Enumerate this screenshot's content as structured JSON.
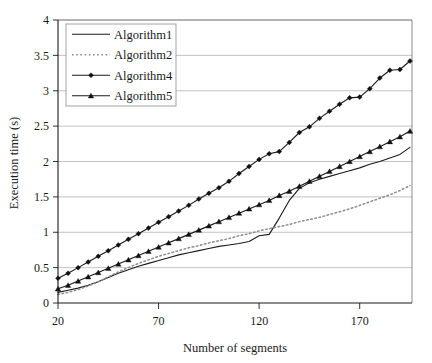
{
  "chart_data": {
    "type": "line",
    "title": "",
    "xlabel": "Number of segments",
    "ylabel": "Execution time (s)",
    "xlim": [
      20,
      196
    ],
    "ylim": [
      0,
      4
    ],
    "xticks": [
      20,
      70,
      120,
      170
    ],
    "xtick_labels": [
      "20",
      "70",
      "120",
      "170"
    ],
    "yticks": [
      0,
      0.5,
      1,
      1.5,
      2,
      2.5,
      3,
      3.5,
      4
    ],
    "ytick_labels": [
      "0",
      "0.5",
      "1",
      "1.5",
      "2",
      "2.5",
      "3",
      "3.5",
      "4"
    ],
    "grid": "horizontal",
    "legend_position": "top-left",
    "x": [
      20,
      25,
      30,
      35,
      40,
      45,
      50,
      55,
      60,
      65,
      70,
      75,
      80,
      85,
      90,
      95,
      100,
      105,
      110,
      115,
      120,
      125,
      130,
      135,
      140,
      145,
      150,
      155,
      160,
      165,
      170,
      175,
      180,
      185,
      190,
      195
    ],
    "series": [
      {
        "name": "Algorithm1",
        "style": "solid",
        "marker": "none",
        "color": "#1a1a1a",
        "values": [
          0.15,
          0.18,
          0.21,
          0.25,
          0.3,
          0.36,
          0.42,
          0.47,
          0.52,
          0.56,
          0.6,
          0.64,
          0.68,
          0.71,
          0.74,
          0.77,
          0.8,
          0.82,
          0.84,
          0.87,
          0.95,
          0.97,
          1.2,
          1.45,
          1.62,
          1.7,
          1.75,
          1.79,
          1.83,
          1.87,
          1.91,
          1.96,
          2.0,
          2.05,
          2.1,
          2.2
        ]
      },
      {
        "name": "Algorithm2",
        "style": "dotted",
        "marker": "none",
        "color": "#8c8c8c",
        "values": [
          0.12,
          0.15,
          0.19,
          0.24,
          0.3,
          0.37,
          0.44,
          0.5,
          0.56,
          0.61,
          0.66,
          0.7,
          0.74,
          0.78,
          0.81,
          0.85,
          0.88,
          0.91,
          0.95,
          0.98,
          1.02,
          1.05,
          1.08,
          1.11,
          1.15,
          1.18,
          1.21,
          1.25,
          1.29,
          1.33,
          1.38,
          1.43,
          1.48,
          1.53,
          1.59,
          1.66
        ]
      },
      {
        "name": "Algorithm4",
        "style": "solid",
        "marker": "diamond",
        "color": "#1a1a1a",
        "values": [
          0.35,
          0.42,
          0.5,
          0.58,
          0.66,
          0.74,
          0.82,
          0.9,
          0.98,
          1.06,
          1.14,
          1.22,
          1.3,
          1.38,
          1.47,
          1.55,
          1.63,
          1.72,
          1.83,
          1.93,
          2.03,
          2.11,
          2.14,
          2.27,
          2.41,
          2.49,
          2.61,
          2.71,
          2.81,
          2.9,
          2.91,
          3.03,
          3.18,
          3.29,
          3.3,
          3.42
        ]
      },
      {
        "name": "Algorithm5",
        "style": "solid",
        "marker": "triangle",
        "color": "#1a1a1a",
        "values": [
          0.2,
          0.25,
          0.31,
          0.37,
          0.43,
          0.49,
          0.55,
          0.61,
          0.67,
          0.73,
          0.79,
          0.85,
          0.91,
          0.97,
          1.03,
          1.09,
          1.15,
          1.21,
          1.27,
          1.33,
          1.39,
          1.45,
          1.52,
          1.58,
          1.65,
          1.72,
          1.79,
          1.86,
          1.93,
          2.0,
          2.07,
          2.14,
          2.21,
          2.28,
          2.35,
          2.43
        ]
      }
    ],
    "endpoints": {
      "Algorithm4_final": 3.65,
      "Algorithm5_final": 2.45,
      "Algorithm1_final": 2.2,
      "Algorithm2_final": 1.66
    }
  },
  "legend": {
    "items": [
      {
        "label": "Algorithm1"
      },
      {
        "label": "Algorithm2"
      },
      {
        "label": "Algorithm4"
      },
      {
        "label": "Algorithm5"
      }
    ]
  },
  "colors": {
    "axis": "#1a1a1a",
    "grid": "#a9a9a9",
    "plot_border": "#6e6e6e",
    "series_dark": "#1a1a1a",
    "series_gray": "#8c8c8c",
    "background": "#ffffff"
  }
}
